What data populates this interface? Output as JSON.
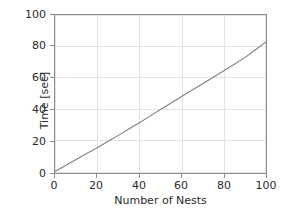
{
  "chart_data": {
    "type": "line",
    "title": "",
    "xlabel": "Number of Nests",
    "ylabel": "Time [sec]",
    "xlim": [
      0,
      100
    ],
    "ylim": [
      0,
      100
    ],
    "xticks": [
      0,
      20,
      40,
      60,
      80,
      100
    ],
    "yticks": [
      0,
      20,
      40,
      60,
      80,
      100
    ],
    "xticklabels": [
      "0",
      "20",
      "40",
      "60",
      "80",
      "100"
    ],
    "yticklabels": [
      "0",
      "20",
      "40",
      "60",
      "80",
      "100"
    ],
    "grid": true,
    "legend": false,
    "line_color": "#808080",
    "axes_color": "#8c8c8c",
    "grid_color": "#e3e3e3",
    "background": "#ffffff",
    "series": [
      {
        "name": "Time vs Number of Nests",
        "x": [
          0,
          5,
          10,
          15,
          20,
          25,
          30,
          35,
          40,
          45,
          50,
          55,
          60,
          65,
          70,
          75,
          80,
          85,
          90,
          95,
          100
        ],
        "y": [
          1.0,
          4.8,
          8.5,
          12.3,
          16.0,
          19.9,
          23.8,
          27.8,
          31.8,
          36.0,
          40.2,
          44.3,
          48.4,
          52.5,
          56.5,
          60.6,
          64.7,
          68.8,
          73.0,
          78.0,
          83.0
        ]
      }
    ]
  }
}
